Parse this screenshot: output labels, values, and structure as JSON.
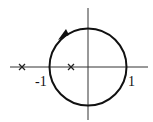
{
  "diagram": {
    "type": "pole-zero contour plot",
    "contour": {
      "shape": "unit circle",
      "direction": "counterclockwise"
    },
    "labels": {
      "neg_one": "-1",
      "pos_one": "1"
    },
    "poles": [
      {
        "x": -2.2,
        "marker": "x"
      },
      {
        "x": -0.45,
        "marker": "x"
      }
    ],
    "colors": {
      "stroke": "#111111",
      "background": "#ffffff"
    }
  }
}
